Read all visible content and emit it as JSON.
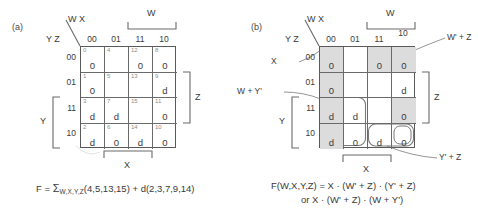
{
  "figure": {
    "panel_a": {
      "tag": "(a)",
      "top_var_label": "W X",
      "side_var_label": "Y Z",
      "col_headers": [
        "00",
        "01",
        "11",
        "10"
      ],
      "row_headers": [
        "00",
        "01",
        "11",
        "10"
      ],
      "brackets": [
        {
          "name": "W",
          "label": "W",
          "position": "top",
          "spans_columns": [
            "11",
            "10"
          ]
        },
        {
          "name": "X",
          "label": "X",
          "position": "bottom",
          "spans_columns": [
            "01",
            "11"
          ]
        },
        {
          "name": "Y",
          "label": "Y",
          "position": "left",
          "spans_rows": [
            "11",
            "10"
          ]
        },
        {
          "name": "Z",
          "label": "Z",
          "position": "right",
          "spans_rows": [
            "01",
            "11"
          ]
        }
      ],
      "cells": [
        [
          {
            "index": "0",
            "value": "0"
          },
          {
            "index": "4",
            "value": ""
          },
          {
            "index": "12",
            "value": "0"
          },
          {
            "index": "8",
            "value": "0"
          }
        ],
        [
          {
            "index": "1",
            "value": "0"
          },
          {
            "index": "5",
            "value": ""
          },
          {
            "index": "13",
            "value": ""
          },
          {
            "index": "9",
            "value": "d"
          }
        ],
        [
          {
            "index": "3",
            "value": "d"
          },
          {
            "index": "7",
            "value": "d"
          },
          {
            "index": "15",
            "value": ""
          },
          {
            "index": "11",
            "value": "0"
          }
        ],
        [
          {
            "index": "2",
            "value": "d"
          },
          {
            "index": "6",
            "value": "0"
          },
          {
            "index": "14",
            "value": "d"
          },
          {
            "index": "10",
            "value": "0"
          }
        ]
      ],
      "formula": {
        "lhs": "F = ",
        "sigma": "Σ",
        "sigma_sub": "W,X,Y,Z",
        "minterms": "(4,5,13,15)",
        "plus": " + d",
        "dontcares": "(2,3,7,9,14)"
      }
    },
    "panel_b": {
      "tag": "(b)",
      "top_var_label": "W X",
      "side_var_label": "Y Z",
      "col_headers": [
        "00",
        "01",
        "11",
        "10"
      ],
      "row_headers": [
        "00",
        "01",
        "11",
        "10"
      ],
      "brackets": [
        {
          "name": "W",
          "label": "W",
          "position": "top",
          "spans_columns": [
            "11",
            "10"
          ]
        },
        {
          "name": "X",
          "label": "X",
          "position": "bottom",
          "spans_columns": [
            "01",
            "11"
          ]
        },
        {
          "name": "Y",
          "label": "Y",
          "position": "left",
          "spans_rows": [
            "11",
            "10"
          ]
        },
        {
          "name": "Z",
          "label": "Z",
          "position": "right",
          "spans_rows": [
            "01",
            "11"
          ]
        }
      ],
      "cells": [
        [
          {
            "index": "",
            "value": "0",
            "shaded": true
          },
          {
            "index": "",
            "value": "",
            "shaded": false
          },
          {
            "index": "",
            "value": "0",
            "shaded": true
          },
          {
            "index": "",
            "value": "0",
            "shaded": true
          }
        ],
        [
          {
            "index": "",
            "value": "0",
            "shaded": true
          },
          {
            "index": "",
            "value": "",
            "shaded": false
          },
          {
            "index": "",
            "value": "",
            "shaded": false
          },
          {
            "index": "",
            "value": "d",
            "shaded": false
          }
        ],
        [
          {
            "index": "",
            "value": "d",
            "shaded": true
          },
          {
            "index": "",
            "value": "d",
            "shaded": false
          },
          {
            "index": "",
            "value": "",
            "shaded": false
          },
          {
            "index": "",
            "value": "0",
            "shaded": true
          }
        ],
        [
          {
            "index": "",
            "value": "d",
            "shaded": true
          },
          {
            "index": "",
            "value": "0",
            "shaded": false
          },
          {
            "index": "",
            "value": "d",
            "shaded": false
          },
          {
            "index": "",
            "value": "0",
            "shaded": false
          }
        ]
      ],
      "group_labels": {
        "x_group": "X",
        "w_plus_yprime": "W + Y'",
        "wprime_plus_z": "W' + Z",
        "yprime_plus_z": "Y' + Z"
      },
      "formula": {
        "line1": "F(W,X,Y,Z) = X · (W' + Z) · (Y' + Z)",
        "line2": "or  X · (W' + Z) · (W + Y')"
      }
    },
    "colors": {
      "shade": "#dcdcdc",
      "grid_line": "#6a6a6a",
      "border": "#5a5a5a",
      "text": "#3a3a3a",
      "index_text": "#8c8c8c"
    }
  }
}
